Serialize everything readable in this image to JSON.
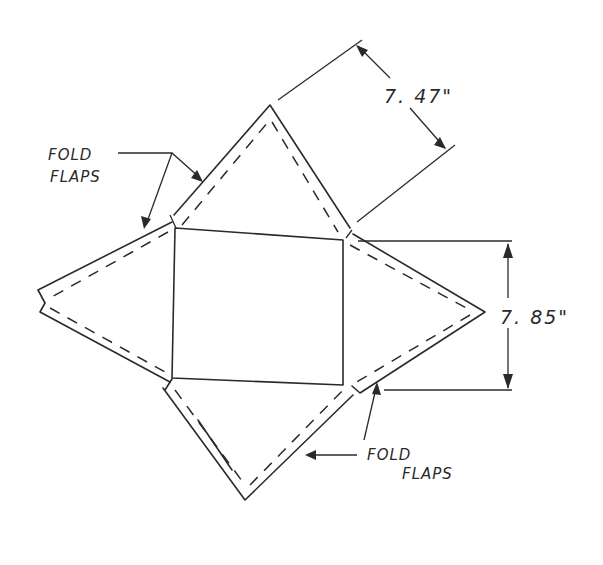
{
  "diagram": {
    "labels": {
      "fold_flaps_top_line1": "FOLD",
      "fold_flaps_top_line2": "FLAPS",
      "fold_flaps_bottom_line1": "FOLD",
      "fold_flaps_bottom_line2": "FLAPS",
      "dimension_slant": "7. 47\"",
      "dimension_base": "7. 85\""
    },
    "parts": {
      "base": "square",
      "faces": [
        "top-triangle",
        "right-triangle",
        "bottom-triangle",
        "left-triangle"
      ],
      "flap_style": "dashed fold lines along triangle edges"
    },
    "colors": {
      "ink": "#2a2a2a",
      "background": "#ffffff"
    }
  }
}
